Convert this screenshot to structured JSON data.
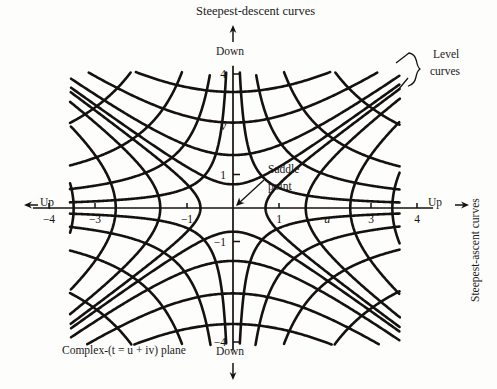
{
  "figure": {
    "caption_bottom": "Complex-(t = u + iv) plane",
    "label_top": "Steepest-descent curves",
    "label_right_vertical": "Steepest-ascent curves",
    "label_level_curves_line1": "Level",
    "label_level_curves_line2": "curves",
    "label_saddle_line1": "Saddle",
    "label_saddle_line2": "point",
    "label_down_top": "Down",
    "label_down_bottom": "Down",
    "label_up_left": "Up",
    "label_up_right": "Up",
    "axis_label_u": "u",
    "axis_label_v": "v",
    "ink_color": "#15110f",
    "background_color": "#fdfdfc"
  },
  "axes": {
    "x_ticks": [
      {
        "value": -4,
        "label": "−4"
      },
      {
        "value": -3,
        "label": "−3"
      },
      {
        "value": -1,
        "label": "−1"
      },
      {
        "value": 1,
        "label": "1"
      },
      {
        "value": 3,
        "label": "3"
      },
      {
        "value": 4,
        "label": "4"
      }
    ],
    "y_ticks": [
      {
        "value": 4,
        "label": "4"
      },
      {
        "value": 1,
        "label": "1"
      },
      {
        "value": -1,
        "label": "−1"
      },
      {
        "value": -4,
        "label": "−4"
      }
    ],
    "xlim": [
      -4.6,
      4.6
    ],
    "ylim": [
      -4.6,
      4.6
    ]
  },
  "chart_data": {
    "type": "line",
    "title": "Steepest-descent curves",
    "xlabel": "u",
    "ylabel": "v",
    "xlim": [
      -4.6,
      4.6
    ],
    "ylim": [
      -4.6,
      4.6
    ],
    "grid": false,
    "legend": [
      "Level curves",
      "Steepest-descent curves"
    ],
    "legend_position": "annotated",
    "saddle_point": [
      0,
      0
    ],
    "series": [
      {
        "name": "Level curves",
        "equation": "u*v = c",
        "constants": [
          -9,
          -4.5,
          -2,
          -0.6,
          0.6,
          2,
          4.5,
          9
        ]
      },
      {
        "name": "Steepest-descent curves",
        "equation": "u^2 - v^2 = c",
        "constants": [
          -12,
          -6.5,
          -2.5,
          -0.5,
          0.5,
          2.5,
          6.5,
          12
        ]
      }
    ]
  }
}
